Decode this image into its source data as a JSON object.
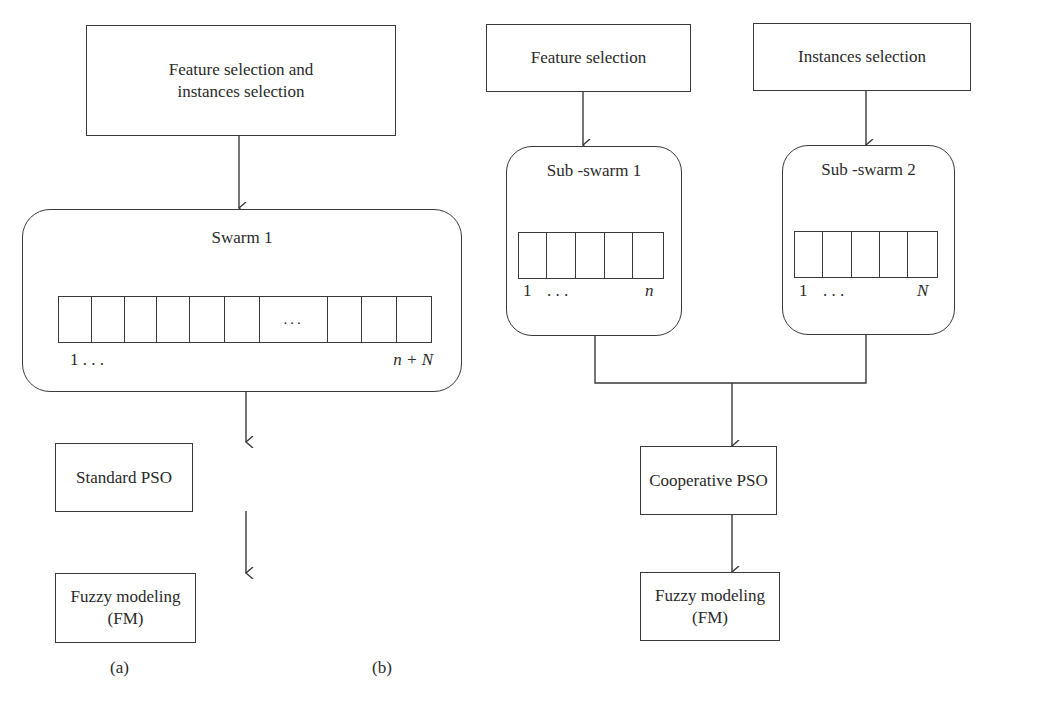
{
  "diagram_a": {
    "input_box": {
      "line1": "Feature selection and",
      "line2": "instances selection"
    },
    "swarm": {
      "title": "Swarm 1",
      "cells": [
        "",
        "",
        "",
        "",
        "",
        "",
        "...",
        "",
        "",
        ""
      ],
      "index_start": "1 . . .",
      "index_end": "n + N"
    },
    "optimizer_box": "Standard PSO",
    "model_box": "Fuzzy modeling (FM)",
    "caption": "(a)"
  },
  "diagram_b": {
    "input_left": "Feature selection",
    "input_right": "Instances selection",
    "subswarm_1": {
      "title": "Sub -swarm 1",
      "cells": [
        "",
        "",
        "",
        "",
        ""
      ],
      "index_start": "1",
      "index_dots": ". . .",
      "index_end": "n"
    },
    "subswarm_2": {
      "title": "Sub -swarm 2",
      "cells": [
        "",
        "",
        "",
        "",
        ""
      ],
      "index_start": "1",
      "index_dots": ". . .",
      "index_end": "N"
    },
    "optimizer_box": "Cooperative PSO",
    "model_box": "Fuzzy modeling (FM)",
    "caption": "(b)"
  }
}
